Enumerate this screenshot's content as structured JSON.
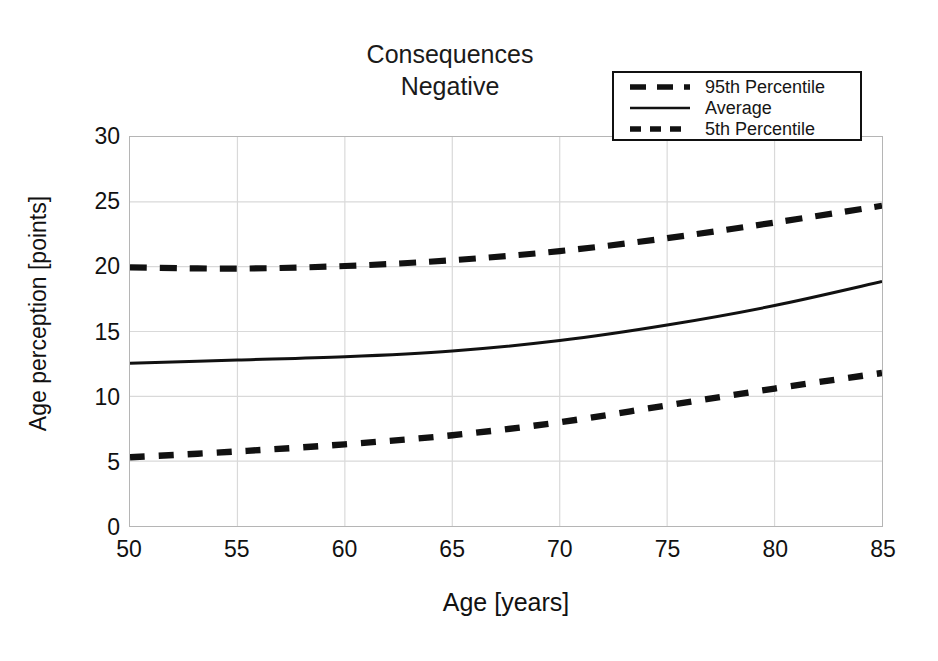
{
  "chart_data": {
    "type": "line",
    "title": "Consequences\nNegative",
    "xlabel": "Age [years]",
    "ylabel": "Age perception [points]",
    "xlim": [
      50,
      85
    ],
    "ylim": [
      0,
      30
    ],
    "xticks": [
      50,
      55,
      60,
      65,
      70,
      75,
      80,
      85
    ],
    "yticks": [
      0,
      5,
      10,
      15,
      20,
      25,
      30
    ],
    "grid": true,
    "legend_position": "top-right",
    "x": [
      50,
      55,
      60,
      65,
      70,
      75,
      80,
      85
    ],
    "series": [
      {
        "name": "95th Percentile",
        "style": "dashed-long",
        "color": "#111111",
        "values": [
          19.95,
          19.85,
          20.05,
          20.5,
          21.2,
          22.2,
          23.4,
          24.7
        ]
      },
      {
        "name": "Average",
        "style": "solid",
        "color": "#111111",
        "values": [
          12.55,
          12.8,
          13.05,
          13.5,
          14.3,
          15.5,
          17.0,
          18.85
        ]
      },
      {
        "name": "5th Percentile",
        "style": "dashed-short",
        "color": "#111111",
        "values": [
          5.3,
          5.75,
          6.3,
          7.0,
          8.0,
          9.3,
          10.6,
          11.8
        ]
      }
    ]
  },
  "legend": {
    "entries": [
      {
        "label": "95th Percentile"
      },
      {
        "label": "Average"
      },
      {
        "label": "5th Percentile"
      }
    ]
  },
  "colors": {
    "line": "#111111",
    "grid": "#d9d9d9",
    "frame": "#b5b5b5",
    "background": "#ffffff"
  }
}
